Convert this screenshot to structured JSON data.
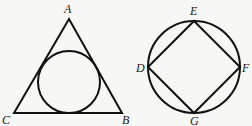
{
  "figure": {
    "left": {
      "shape": "triangle with inscribed circle",
      "vertices": {
        "A": {
          "label": "A",
          "x": 69,
          "y": 19
        },
        "B": {
          "label": "B",
          "x": 122,
          "y": 113
        },
        "C": {
          "label": "C",
          "x": 14,
          "y": 113
        }
      },
      "incircle": {
        "cx": 69,
        "cy": 82,
        "r": 31
      }
    },
    "right": {
      "shape": "circle with inscribed square",
      "circle": {
        "cx": 194,
        "cy": 67,
        "r": 46
      },
      "vertices": {
        "D": {
          "label": "D",
          "x": 148,
          "y": 67
        },
        "E": {
          "label": "E",
          "x": 194,
          "y": 21
        },
        "F": {
          "label": "F",
          "x": 240,
          "y": 67
        },
        "G": {
          "label": "G",
          "x": 194,
          "y": 113
        }
      }
    }
  }
}
